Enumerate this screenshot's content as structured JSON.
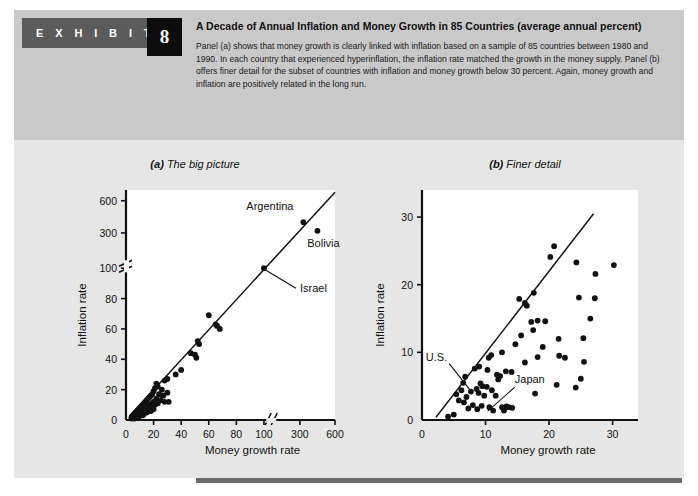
{
  "exhibit": {
    "label": "E X H I B I T",
    "number": "8"
  },
  "caption": {
    "title": "A Decade of Annual Inflation and Money Growth in 85 Countries (average annual percent)",
    "body": "Panel (a) shows that money growth is clearly linked with inflation based on a sample of 85 countries between 1980 and 1990. In each country that experienced hyperinflation, the inflation rate matched the growth in the money supply. Panel (b) offers finer detail for the subset of countries with inflation and money growth below 30 percent. Again, money growth and inflation are positively related in the long run."
  },
  "colors": {
    "header_band": "#c9c9c9",
    "body_band": "#e6e6e6",
    "tag_grey": "#5b5b5b",
    "tag_black": "#0d0d0d",
    "plot_bg": "#ffffff",
    "axis": "#111111",
    "marker": "#111111"
  },
  "chart_data": [
    {
      "type": "scatter",
      "panel": "a",
      "title_prefix": "(a)",
      "title": "The big picture",
      "xlabel": "Money growth rate",
      "ylabel": "Inflation rate",
      "grid": false,
      "legend": null,
      "axis_break_x": true,
      "axis_break_y": true,
      "xticks": [
        0,
        20,
        40,
        60,
        80,
        100,
        300,
        600
      ],
      "yticks": [
        0,
        20,
        40,
        60,
        80,
        100,
        300,
        600
      ],
      "xlim": [
        0,
        600
      ],
      "ylim": [
        0,
        700
      ],
      "trendline": {
        "from": [
          3,
          3
        ],
        "to": [
          600,
          680
        ],
        "note": "45-degree reference line"
      },
      "annotations": [
        {
          "text": "Argentina",
          "x": 330,
          "y": 400,
          "anchor": "label-left"
        },
        {
          "text": "Bolivia",
          "x": 450,
          "y": 320,
          "anchor": "label-below"
        },
        {
          "text": "Israel",
          "x": 100,
          "y": 100,
          "anchor": "leader-right"
        }
      ],
      "points": [
        [
          330,
          400
        ],
        [
          450,
          320
        ],
        [
          100,
          100
        ],
        [
          60,
          69
        ],
        [
          65,
          63
        ],
        [
          66,
          62
        ],
        [
          68,
          60
        ],
        [
          52,
          52
        ],
        [
          53,
          50
        ],
        [
          47,
          44
        ],
        [
          50,
          43
        ],
        [
          51,
          41
        ],
        [
          40,
          33
        ],
        [
          36,
          30
        ],
        [
          30,
          27
        ],
        [
          28,
          26
        ],
        [
          22,
          24
        ],
        [
          23,
          22
        ],
        [
          21,
          21
        ],
        [
          26,
          20
        ],
        [
          30,
          18
        ],
        [
          20,
          19
        ],
        [
          19,
          17
        ],
        [
          24,
          17
        ],
        [
          18,
          16
        ],
        [
          27,
          16
        ],
        [
          17,
          15
        ],
        [
          22,
          14
        ],
        [
          16,
          14
        ],
        [
          25,
          13
        ],
        [
          31,
          12
        ],
        [
          15,
          13
        ],
        [
          20,
          12
        ],
        [
          14,
          12
        ],
        [
          23,
          11
        ],
        [
          19,
          11
        ],
        [
          13,
          11
        ],
        [
          18,
          10
        ],
        [
          12,
          10
        ],
        [
          21,
          10
        ],
        [
          16,
          10
        ],
        [
          12,
          9
        ],
        [
          15,
          9
        ],
        [
          17,
          9
        ],
        [
          11,
          9
        ],
        [
          19,
          8
        ],
        [
          10,
          8
        ],
        [
          14,
          8
        ],
        [
          13,
          8
        ],
        [
          16,
          8
        ],
        [
          20,
          7
        ],
        [
          9,
          7
        ],
        [
          12,
          7
        ],
        [
          15,
          7
        ],
        [
          11,
          7
        ],
        [
          18,
          6
        ],
        [
          8,
          6
        ],
        [
          10,
          6
        ],
        [
          13,
          6
        ],
        [
          14,
          6
        ],
        [
          17,
          6
        ],
        [
          8,
          5
        ],
        [
          9,
          5
        ],
        [
          11,
          5
        ],
        [
          12,
          5
        ],
        [
          15,
          5
        ],
        [
          7,
          5
        ],
        [
          10,
          4
        ],
        [
          13,
          4
        ],
        [
          8,
          4
        ],
        [
          11,
          4
        ],
        [
          6,
          4
        ],
        [
          9,
          3
        ],
        [
          12,
          3
        ],
        [
          7,
          3
        ],
        [
          10,
          3
        ],
        [
          5,
          3
        ],
        [
          8,
          3
        ],
        [
          6,
          2
        ],
        [
          9,
          2
        ],
        [
          7,
          2
        ],
        [
          4,
          2
        ],
        [
          5,
          2
        ],
        [
          6,
          1
        ],
        [
          4,
          1
        ],
        [
          28,
          12
        ]
      ]
    },
    {
      "type": "scatter",
      "panel": "b",
      "title_prefix": "(b)",
      "title": "Finer detail",
      "xlabel": "Money growth rate",
      "ylabel": "Inflation rate",
      "grid": false,
      "legend": null,
      "axis_break_x": false,
      "axis_break_y": false,
      "xticks": [
        0,
        10,
        20,
        30
      ],
      "yticks": [
        0,
        10,
        20,
        30
      ],
      "xlim": [
        0,
        34
      ],
      "ylim": [
        0,
        34
      ],
      "trendline": {
        "from": [
          2.2,
          0.4
        ],
        "to": [
          27,
          30.5
        ],
        "note": "45-degree reference line"
      },
      "annotations": [
        {
          "text": "U.S.",
          "x": 6.8,
          "y": 6.4,
          "anchor": "leader-upleft"
        },
        {
          "text": "Japan",
          "x": 12.4,
          "y": 2.2,
          "anchor": "leader-upright"
        }
      ],
      "points": [
        [
          20.8,
          25.7
        ],
        [
          20.2,
          24.1
        ],
        [
          24.3,
          23.3
        ],
        [
          30.2,
          22.9
        ],
        [
          27.3,
          21.6
        ],
        [
          24.7,
          18.1
        ],
        [
          27.2,
          18.0
        ],
        [
          15.3,
          17.9
        ],
        [
          17.6,
          18.8
        ],
        [
          16.5,
          16.9
        ],
        [
          16.2,
          17.3
        ],
        [
          18.2,
          14.7
        ],
        [
          19.4,
          14.6
        ],
        [
          17.2,
          14.5
        ],
        [
          17.5,
          13.3
        ],
        [
          21.5,
          12.0
        ],
        [
          25.4,
          12.1
        ],
        [
          14.7,
          11.2
        ],
        [
          12.6,
          10.0
        ],
        [
          10.9,
          9.6
        ],
        [
          10.5,
          9.2
        ],
        [
          18.2,
          9.3
        ],
        [
          21.6,
          9.5
        ],
        [
          22.5,
          9.2
        ],
        [
          25.5,
          8.6
        ],
        [
          16.2,
          8.5
        ],
        [
          9.0,
          7.9
        ],
        [
          8.3,
          7.6
        ],
        [
          10.3,
          7.4
        ],
        [
          13.2,
          7.2
        ],
        [
          14.1,
          7.1
        ],
        [
          11.8,
          6.7
        ],
        [
          12.3,
          6.5
        ],
        [
          12.0,
          6.0
        ],
        [
          6.8,
          6.4
        ],
        [
          6.5,
          5.5
        ],
        [
          21.2,
          5.2
        ],
        [
          25.0,
          6.1
        ],
        [
          24.2,
          4.8
        ],
        [
          17.8,
          3.9
        ],
        [
          9.2,
          5.4
        ],
        [
          9.5,
          5.0
        ],
        [
          8.6,
          4.6
        ],
        [
          10.2,
          4.9
        ],
        [
          11.0,
          4.4
        ],
        [
          7.7,
          4.2
        ],
        [
          8.9,
          4.0
        ],
        [
          6.2,
          4.4
        ],
        [
          5.4,
          3.8
        ],
        [
          7.0,
          3.4
        ],
        [
          9.8,
          3.6
        ],
        [
          11.6,
          3.6
        ],
        [
          5.8,
          2.9
        ],
        [
          6.6,
          2.6
        ],
        [
          8.0,
          2.2
        ],
        [
          9.4,
          2.1
        ],
        [
          10.6,
          1.9
        ],
        [
          12.6,
          1.9
        ],
        [
          13.6,
          1.9
        ],
        [
          14.2,
          1.8
        ],
        [
          7.3,
          1.7
        ],
        [
          8.7,
          1.6
        ],
        [
          11.2,
          1.4
        ],
        [
          12.9,
          1.4
        ],
        [
          4.1,
          0.5
        ],
        [
          5.0,
          0.8
        ],
        [
          13.3,
          2.0
        ],
        [
          19.0,
          10.8
        ],
        [
          15.6,
          12.5
        ],
        [
          26.5,
          15.0
        ]
      ]
    }
  ]
}
